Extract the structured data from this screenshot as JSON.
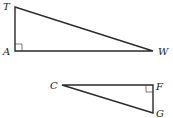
{
  "diagram": {
    "type": "similar-right-triangles",
    "triangles": [
      {
        "name": "TAW",
        "right_angle_at": "A",
        "vertices": [
          {
            "label": "T",
            "x": 15,
            "y": 7
          },
          {
            "label": "A",
            "x": 15,
            "y": 51
          },
          {
            "label": "W",
            "x": 153,
            "y": 51
          }
        ]
      },
      {
        "name": "CFG",
        "right_angle_at": "F",
        "vertices": [
          {
            "label": "C",
            "x": 62,
            "y": 85
          },
          {
            "label": "F",
            "x": 153,
            "y": 85
          },
          {
            "label": "G",
            "x": 153,
            "y": 113
          }
        ]
      }
    ],
    "labels": {
      "T": "T",
      "A": "A",
      "W": "W",
      "C": "C",
      "F": "F",
      "G": "G"
    }
  }
}
